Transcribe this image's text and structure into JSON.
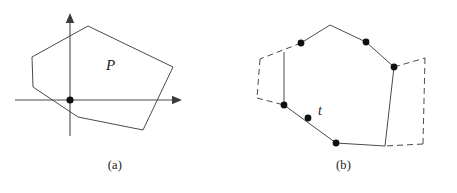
{
  "figure": {
    "panels": [
      {
        "id": "a",
        "caption": "(a)",
        "region_label": "P",
        "description": "convex polygon P drawn over a pair of coordinate axes with the origin marked by a filled dot",
        "axes": {
          "x_axis": {
            "x1": 15,
            "y1": 100,
            "x2": 182,
            "y2": 100,
            "arrow": "right"
          },
          "y_axis": {
            "x1": 70,
            "y1": 136,
            "x2": 70,
            "y2": 13,
            "arrow": "up"
          },
          "origin": {
            "x": 70,
            "y": 100,
            "marker": "filled-dot"
          }
        },
        "polygon": {
          "name": "P",
          "closed": true,
          "vertices": [
            {
              "x": 88,
              "y": 26
            },
            {
              "x": 173,
              "y": 67
            },
            {
              "x": 143,
              "y": 130
            },
            {
              "x": 78,
              "y": 117
            },
            {
              "x": 33,
              "y": 87
            },
            {
              "x": 32,
              "y": 57
            }
          ]
        },
        "label_position": {
          "x": 106,
          "y": 70
        }
      },
      {
        "id": "b",
        "caption": "(b)",
        "point_label": "t",
        "description": "the same convex polygon with some edges solid and the remaining boundary drawn dashed, five vertices marked with filled dots plus an interior point t",
        "polygon": {
          "closed": true,
          "vertices": [
            {
              "x": 100,
              "y": 25,
              "style": "corner"
            },
            {
              "x": 136,
              "y": 42,
              "style": "corner"
            },
            {
              "x": 164,
              "y": 67,
              "style": "corner"
            },
            {
              "x": 162,
              "y": 146,
              "style": "corner"
            },
            {
              "x": 106,
              "y": 143,
              "style": "corner"
            },
            {
              "x": 54,
              "y": 105,
              "style": "corner"
            },
            {
              "x": 52,
              "y": 54,
              "style": "corner"
            },
            {
              "x": 71,
              "y": 43,
              "style": "corner"
            }
          ]
        },
        "solid_edges": [
          {
            "x1": 71,
            "y1": 43,
            "x2": 100,
            "y2": 25
          },
          {
            "x1": 100,
            "y1": 25,
            "x2": 136,
            "y2": 42
          },
          {
            "x1": 136,
            "y1": 42,
            "x2": 164,
            "y2": 67
          },
          {
            "x1": 164,
            "y1": 67,
            "x2": 155,
            "y2": 146
          },
          {
            "x1": 54,
            "y1": 105,
            "x2": 106,
            "y2": 143
          },
          {
            "x1": 106,
            "y1": 143,
            "x2": 155,
            "y2": 146
          },
          {
            "x1": 54,
            "y1": 52,
            "x2": 54,
            "y2": 105
          }
        ],
        "dashed_edges": [
          {
            "x1": 71,
            "y1": 43,
            "x2": 30,
            "y2": 59
          },
          {
            "x1": 30,
            "y1": 59,
            "x2": 27,
            "y2": 98
          },
          {
            "x1": 27,
            "y1": 98,
            "x2": 54,
            "y2": 105
          },
          {
            "x1": 164,
            "y1": 67,
            "x2": 195,
            "y2": 58
          },
          {
            "x1": 195,
            "y1": 58,
            "x2": 193,
            "y2": 144
          },
          {
            "x1": 193,
            "y1": 144,
            "x2": 155,
            "y2": 146
          }
        ],
        "marked_points": [
          {
            "x": 71,
            "y": 43,
            "name": "vertex-dot-upper-left"
          },
          {
            "x": 136,
            "y": 42,
            "name": "vertex-dot-upper-right"
          },
          {
            "x": 164,
            "y": 67,
            "name": "vertex-dot-right"
          },
          {
            "x": 54,
            "y": 105,
            "name": "vertex-dot-left"
          },
          {
            "x": 106,
            "y": 143,
            "name": "vertex-dot-bottom"
          },
          {
            "x": 78,
            "y": 118,
            "name": "interior-point-t"
          }
        ],
        "label_position": {
          "x": 88,
          "y": 115
        }
      }
    ]
  },
  "style": {
    "stroke_color": "#4a4a4a",
    "axis_color": "#4a4a4a",
    "dot_color": "#111111",
    "text_color": "#222222",
    "background": "#ffffff",
    "stroke_width": 1,
    "dash_pattern": "6 4"
  }
}
